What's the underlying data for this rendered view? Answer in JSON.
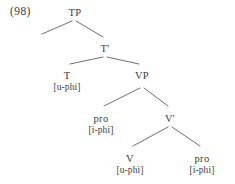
{
  "figure": {
    "example_number": "(98)",
    "kind": "syntax-tree",
    "notation": "x-bar phrase structure"
  },
  "nodes": [
    {
      "id": "tp",
      "label": "TP",
      "feature": "",
      "x": 75,
      "y": 7
    },
    {
      "id": "t-bar",
      "label": "T'",
      "feature": "",
      "x": 105,
      "y": 43
    },
    {
      "id": "t",
      "label": "T",
      "feature": "[u-phi]",
      "x": 67,
      "y": 70
    },
    {
      "id": "vp",
      "label": "VP",
      "feature": "",
      "x": 142,
      "y": 70
    },
    {
      "id": "pro-subject",
      "label": "pro",
      "feature": "[i-phi]",
      "x": 101,
      "y": 113
    },
    {
      "id": "v-bar",
      "label": "V'",
      "feature": "",
      "x": 170,
      "y": 113
    },
    {
      "id": "v",
      "label": "V",
      "feature": "[u-phi]",
      "x": 130,
      "y": 153
    },
    {
      "id": "pro-object",
      "label": "pro",
      "feature": "[i-phi]",
      "x": 202,
      "y": 153
    }
  ],
  "branches": [
    {
      "id": "tp-to-spec",
      "from": "tp",
      "to": "empty-specifier",
      "x1": 72,
      "y1": 21,
      "x2": 42,
      "y2": 34
    },
    {
      "id": "tp-to-tbar",
      "from": "tp",
      "to": "t-bar",
      "x1": 76,
      "y1": 21,
      "x2": 103,
      "y2": 37
    },
    {
      "id": "tbar-to-t",
      "from": "t-bar",
      "to": "t",
      "x1": 103,
      "y1": 57,
      "x2": 70,
      "y2": 64
    },
    {
      "id": "tbar-to-vp",
      "from": "t-bar",
      "to": "vp",
      "x1": 107,
      "y1": 57,
      "x2": 139,
      "y2": 64
    },
    {
      "id": "vp-to-pro",
      "from": "vp",
      "to": "pro-subject",
      "x1": 140,
      "y1": 88,
      "x2": 104,
      "y2": 106
    },
    {
      "id": "vp-to-vbar",
      "from": "vp",
      "to": "v-bar",
      "x1": 144,
      "y1": 88,
      "x2": 168,
      "y2": 106
    },
    {
      "id": "vbar-to-v",
      "from": "v-bar",
      "to": "v",
      "x1": 168,
      "y1": 127,
      "x2": 133,
      "y2": 146
    },
    {
      "id": "vbar-to-pro",
      "from": "v-bar",
      "to": "pro-object",
      "x1": 172,
      "y1": 127,
      "x2": 200,
      "y2": 146
    }
  ],
  "style": {
    "line_color": "#4a4a4a",
    "text_color": "#3c3c3c",
    "background": "#ffffff"
  }
}
